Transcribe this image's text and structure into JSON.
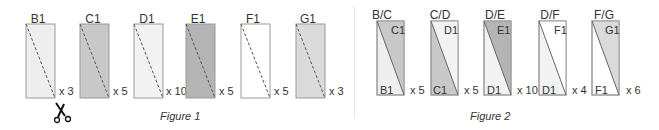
{
  "figure1": {
    "caption": "Figure 1",
    "panels": [
      {
        "label": "B1",
        "mult": "x 3",
        "fill": "#eeeeee"
      },
      {
        "label": "C1",
        "mult": "x 5",
        "fill": "#c8c8c8"
      },
      {
        "label": "D1",
        "mult": "x 10",
        "fill": "#f2f2f2"
      },
      {
        "label": "E1",
        "mult": "x 5",
        "fill": "#b4b4b4"
      },
      {
        "label": "F1",
        "mult": "x 5",
        "fill": "#ffffff"
      },
      {
        "label": "G1",
        "mult": "x 3",
        "fill": "#dadada"
      }
    ],
    "scissors_icon": "scissors-icon"
  },
  "figure2": {
    "caption": "Figure 2",
    "panels": [
      {
        "label": "B/C",
        "top": "C1",
        "bottom": "B1",
        "mult": "x 5",
        "top_fill": "#c8c8c8",
        "bottom_fill": "#eeeeee"
      },
      {
        "label": "C/D",
        "top": "D1",
        "bottom": "C1",
        "mult": "x 5",
        "top_fill": "#f2f2f2",
        "bottom_fill": "#c8c8c8"
      },
      {
        "label": "D/E",
        "top": "E1",
        "bottom": "D1",
        "mult": "x 10",
        "top_fill": "#b4b4b4",
        "bottom_fill": "#f2f2f2"
      },
      {
        "label": "D/F",
        "top": "F1",
        "bottom": "D1",
        "mult": "x 4",
        "top_fill": "#ffffff",
        "bottom_fill": "#f2f2f2"
      },
      {
        "label": "F/G",
        "top": "G1",
        "bottom": "F1",
        "mult": "x 6",
        "top_fill": "#dadada",
        "bottom_fill": "#ffffff"
      }
    ]
  }
}
